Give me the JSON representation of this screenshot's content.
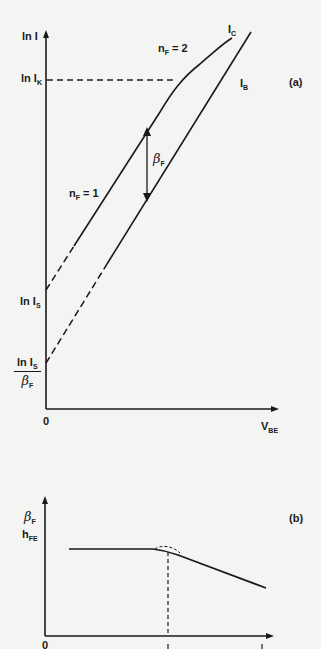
{
  "figure": {
    "panel_a": {
      "tag": "(a)",
      "y_axis_label": "ln I",
      "x_axis_label": "V",
      "x_axis_label_sub": "BE",
      "origin": "0",
      "knee_label": "ln I",
      "knee_label_sub": "K",
      "curve_collector": "I",
      "curve_collector_sub": "C",
      "curve_base": "I",
      "curve_base_sub": "B",
      "n_high": "n",
      "n_high_sub": "F",
      "n_high_value": " = 2",
      "n_low": "n",
      "n_low_sub": "F",
      "n_low_value": " = 1",
      "beta_label": "β",
      "beta_sub": "F",
      "intercept_collector": "ln I",
      "intercept_collector_sub": "S",
      "intercept_base_num": "ln I",
      "intercept_base_num_sub": "S",
      "intercept_base_den": "β",
      "intercept_base_den_sub": "F"
    },
    "panel_b": {
      "tag": "(b)",
      "y_axis_label_1": "β",
      "y_axis_label_1_sub": "F",
      "y_axis_label_2": "h",
      "y_axis_label_2_sub": "FE",
      "origin": "0"
    },
    "colors": {
      "ink": "#1a1a1a",
      "paper": "#f4f4f2"
    }
  }
}
